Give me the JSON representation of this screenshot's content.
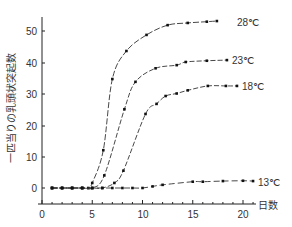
{
  "chart_data": {
    "type": "line",
    "title": "",
    "xlabel": "日数",
    "ylabel": "一匹当りの乳頭状突起数",
    "xlim": [
      0,
      21
    ],
    "ylim": [
      -1,
      55
    ],
    "xticks": [
      0,
      5,
      10,
      15,
      20
    ],
    "yticks": [
      0,
      10,
      20,
      30,
      40,
      50
    ],
    "grid": false,
    "legend": "inline labels at right end of each curve",
    "series": [
      {
        "name": "28℃",
        "label": "28℃",
        "points": [
          [
            1,
            0
          ],
          [
            2,
            0
          ],
          [
            3,
            0
          ],
          [
            4,
            0
          ],
          [
            4.6,
            0
          ],
          [
            5.0,
            1.6
          ],
          [
            6.1,
            12
          ],
          [
            7.0,
            34.6
          ],
          [
            8.4,
            43.5
          ],
          [
            10.4,
            48.6
          ],
          [
            12.5,
            51.7
          ],
          [
            14.5,
            52.4
          ],
          [
            16.4,
            52.8
          ],
          [
            17.4,
            53
          ]
        ]
      },
      {
        "name": "23℃",
        "label": "23℃",
        "points": [
          [
            1,
            0
          ],
          [
            2,
            0
          ],
          [
            3,
            0
          ],
          [
            4,
            0
          ],
          [
            5,
            0
          ],
          [
            6.2,
            4
          ],
          [
            8.2,
            25
          ],
          [
            9.3,
            33.7
          ],
          [
            11.3,
            38
          ],
          [
            13.4,
            39
          ],
          [
            14.3,
            40
          ],
          [
            16.4,
            40.4
          ],
          [
            18.4,
            40.6
          ]
        ]
      },
      {
        "name": "18℃",
        "label": "18℃",
        "points": [
          [
            1,
            0
          ],
          [
            2,
            0
          ],
          [
            3,
            0
          ],
          [
            4,
            0
          ],
          [
            5,
            0
          ],
          [
            6,
            0
          ],
          [
            7.2,
            1.6
          ],
          [
            8.1,
            5.5
          ],
          [
            10.3,
            23.5
          ],
          [
            11.4,
            26.7
          ],
          [
            12.3,
            29.2
          ],
          [
            13.4,
            30
          ],
          [
            14.5,
            31
          ],
          [
            16.5,
            32.4
          ],
          [
            18.3,
            32.4
          ],
          [
            19.4,
            32.4
          ]
        ]
      },
      {
        "name": "13℃",
        "label": "13℃",
        "points": [
          [
            1,
            0
          ],
          [
            2,
            0
          ],
          [
            3,
            0
          ],
          [
            4,
            0
          ],
          [
            5,
            0
          ],
          [
            6,
            0
          ],
          [
            7,
            0
          ],
          [
            8,
            0
          ],
          [
            9,
            0
          ],
          [
            10,
            0
          ],
          [
            11,
            0.5
          ],
          [
            12,
            1
          ],
          [
            15,
            2
          ],
          [
            16,
            2
          ],
          [
            18,
            2.2
          ],
          [
            20,
            2.3
          ],
          [
            21,
            2.2
          ]
        ]
      }
    ]
  },
  "axes": {
    "x_title": "日数",
    "y_title": "一匹当りの乳頭状突起数",
    "x_tick_labels": [
      "0",
      "5",
      "10",
      "15",
      "20"
    ],
    "y_tick_labels": [
      "0",
      "10",
      "20",
      "30",
      "40",
      "50"
    ]
  },
  "labels": {
    "s28": "28℃",
    "s23": "23℃",
    "s18": "18℃",
    "s13": "13℃"
  }
}
